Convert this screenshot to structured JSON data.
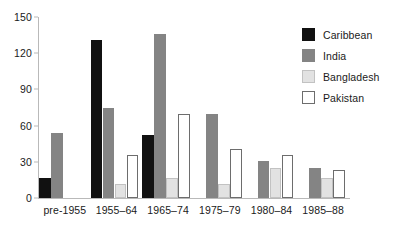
{
  "chart_data": {
    "type": "bar",
    "title": "",
    "subtitle": "",
    "xlabel": "",
    "ylabel": "",
    "ylim": [
      0,
      150
    ],
    "yticks": [
      0,
      30,
      60,
      90,
      120,
      150
    ],
    "grid": false,
    "legend_position": "top-right",
    "categories": [
      "pre-1955",
      "1955–64",
      "1965–74",
      "1975–79",
      "1980–84",
      "1985–88"
    ],
    "series": [
      {
        "name": "Caribbean",
        "color": "#111111",
        "values": [
          17,
          131,
          52,
          0,
          0,
          0
        ]
      },
      {
        "name": "India",
        "color": "#848484",
        "values": [
          54,
          75,
          136,
          70,
          31,
          25
        ]
      },
      {
        "name": "Bangladesh",
        "color": "#e2e2e2",
        "values": [
          0,
          12,
          17,
          12,
          25,
          17
        ]
      },
      {
        "name": "Pakistan",
        "color": "#ffffff",
        "values": [
          0,
          36,
          70,
          41,
          36,
          23
        ]
      }
    ]
  },
  "axis": {
    "y_tick_labels": [
      "0",
      "30",
      "60",
      "90",
      "120",
      "150"
    ],
    "x_tick_labels": [
      "pre-1955",
      "1955–64",
      "1965–74",
      "1975–79",
      "1980–84",
      "1985–88"
    ]
  },
  "legend": {
    "items": [
      {
        "label": "Caribbean",
        "swatch": "caribbean-swatch"
      },
      {
        "label": "India",
        "swatch": "india-swatch"
      },
      {
        "label": "Bangladesh",
        "swatch": "bangladesh-swatch"
      },
      {
        "label": "Pakistan",
        "swatch": "pakistan-swatch"
      }
    ]
  }
}
